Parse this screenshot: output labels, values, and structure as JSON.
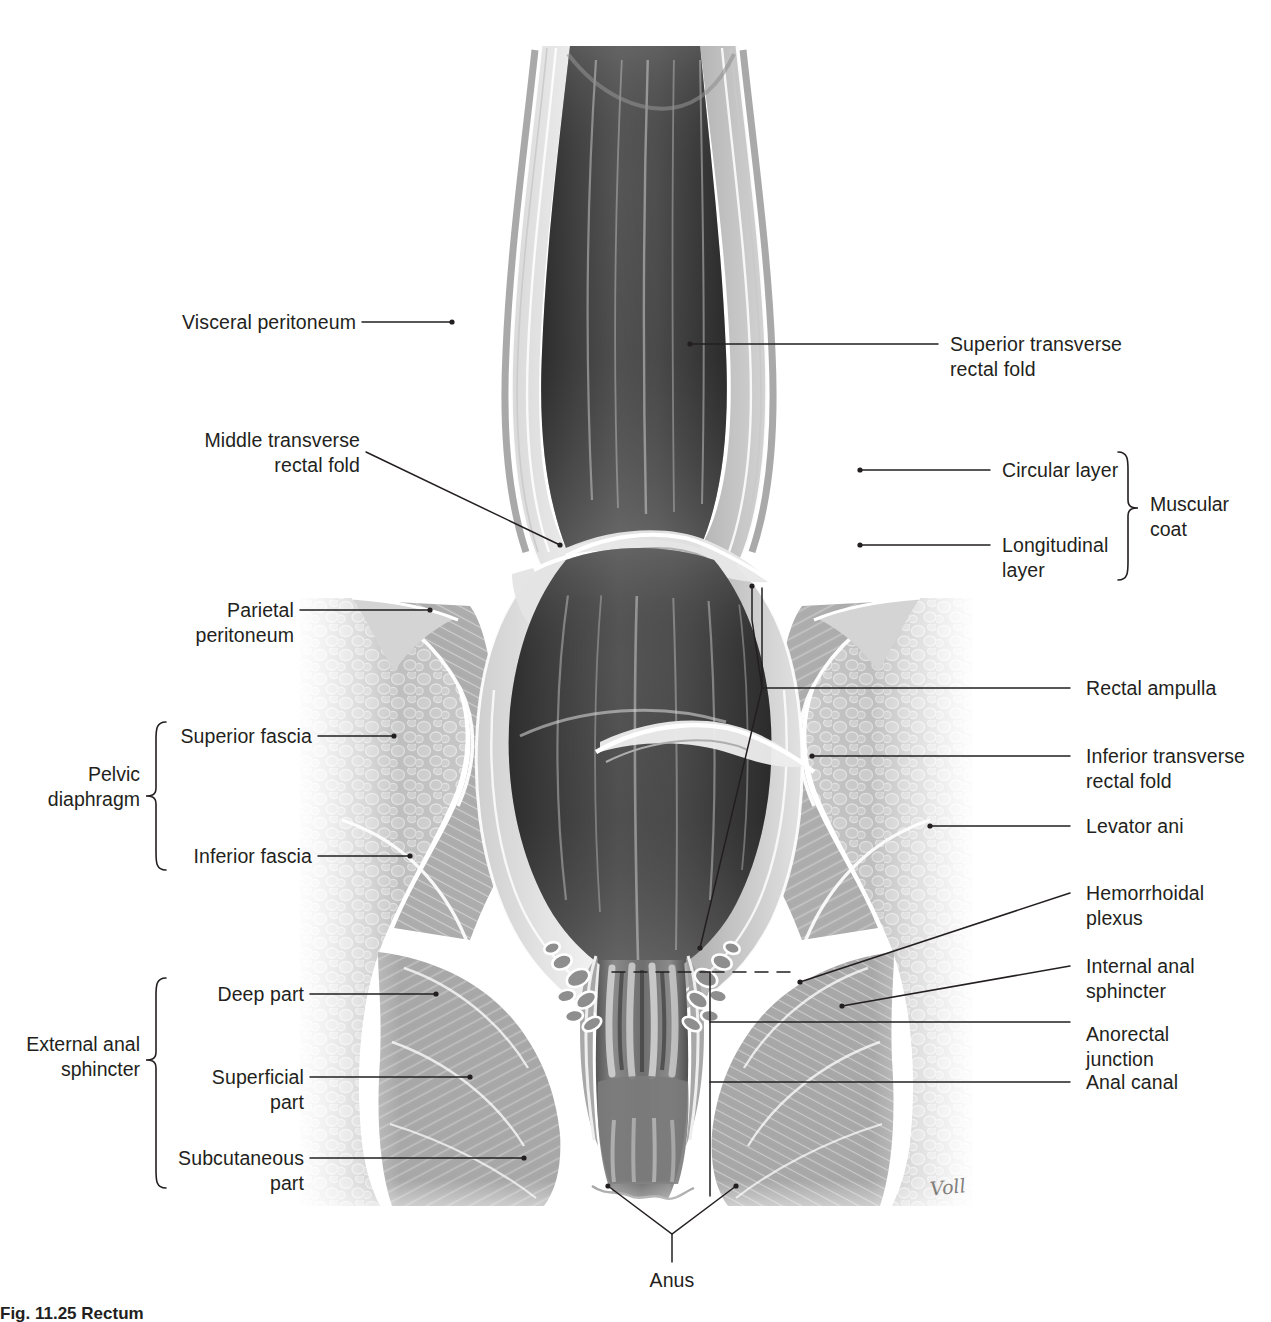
{
  "figure": {
    "number": "Fig. 11.25",
    "title": "Rectum",
    "caption_full": "Fig. 11.25 Rectum",
    "artist_signature": "Voll",
    "view": "Coronal section, anterior view"
  },
  "colors": {
    "ink": "#231f20",
    "leader": "#231f20",
    "background": "#ffffff",
    "lumen_dark": "#3a3a3a",
    "wall_mid": "#8d8d8d",
    "wall_light": "#d8d8d8",
    "tissue": "#b6b6b6"
  },
  "labels_left": [
    {
      "id": "visceral-peritoneum",
      "text": "Visceral peritoneum"
    },
    {
      "id": "middle-transverse-rectal-fold",
      "text": "Middle transverse\nrectal fold"
    },
    {
      "id": "parietal-peritoneum",
      "text": "Parietal\nperitoneum"
    },
    {
      "id": "superior-fascia",
      "text": "Superior fascia"
    },
    {
      "id": "inferior-fascia",
      "text": "Inferior fascia"
    },
    {
      "id": "deep-part",
      "text": "Deep part"
    },
    {
      "id": "superficial-part",
      "text": "Superficial\npart"
    },
    {
      "id": "subcutaneous-part",
      "text": "Subcutaneous\npart"
    }
  ],
  "labels_right": [
    {
      "id": "superior-transverse-rectal-fold",
      "text": "Superior transverse\nrectal fold"
    },
    {
      "id": "circular-layer",
      "text": "Circular layer"
    },
    {
      "id": "longitudinal-layer",
      "text": "Longitudinal\nlayer"
    },
    {
      "id": "rectal-ampulla",
      "text": "Rectal ampulla"
    },
    {
      "id": "inferior-transverse-rectal-fold",
      "text": "Inferior transverse\nrectal fold"
    },
    {
      "id": "levator-ani",
      "text": "Levator ani"
    },
    {
      "id": "hemorrhoidal-plexus",
      "text": "Hemorrhoidal\nplexus"
    },
    {
      "id": "internal-anal-sphincter",
      "text": "Internal anal\nsphincter"
    },
    {
      "id": "anorectal-junction",
      "text": "Anorectal\njunction"
    },
    {
      "id": "anal-canal",
      "text": "Anal canal"
    }
  ],
  "labels_bottom": [
    {
      "id": "anus",
      "text": "Anus"
    }
  ],
  "groups": [
    {
      "id": "pelvic-diaphragm",
      "text": "Pelvic\ndiaphragm",
      "side": "left",
      "members": [
        "superior-fascia",
        "inferior-fascia"
      ]
    },
    {
      "id": "external-anal-sphincter",
      "text": "External anal\nsphincter",
      "side": "left",
      "members": [
        "deep-part",
        "superficial-part",
        "subcutaneous-part"
      ]
    },
    {
      "id": "muscular-coat",
      "text": "Muscular\ncoat",
      "side": "right",
      "members": [
        "circular-layer",
        "longitudinal-layer"
      ]
    }
  ]
}
